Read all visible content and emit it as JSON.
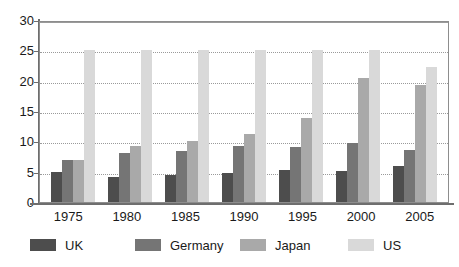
{
  "chart_data": {
    "type": "bar",
    "title": "",
    "subtitle": "",
    "xlabel": "",
    "ylabel": "",
    "categories": [
      "1975",
      "1980",
      "1985",
      "1990",
      "1995",
      "2000",
      "2005"
    ],
    "series": [
      {
        "name": "UK",
        "color": "#4d4d4d",
        "values": [
          5.0,
          4.2,
          4.5,
          4.8,
          5.2,
          5.1,
          5.9
        ]
      },
      {
        "name": "Germany",
        "color": "#757575",
        "values": [
          6.9,
          8.1,
          8.4,
          9.2,
          9.0,
          9.7,
          8.6
        ]
      },
      {
        "name": "Japan",
        "color": "#a9a9a9",
        "values": [
          7.0,
          9.2,
          10.0,
          11.2,
          13.8,
          20.4,
          19.3
        ]
      },
      {
        "name": "US",
        "color": "#d9d9d9",
        "values": [
          25.0,
          25.0,
          25.0,
          25.0,
          25.0,
          25.0,
          22.3
        ]
      }
    ],
    "ylim": [
      0,
      30
    ],
    "ytick_values": [
      0,
      5,
      10,
      15,
      20,
      25,
      30
    ],
    "ytick_labels": [
      "0",
      "5",
      "10",
      "15",
      "20",
      "25",
      "30"
    ],
    "grid": true,
    "grid_axis": "y",
    "legend_position": "bottom",
    "note_clipped_series": "US bars for 1975-2000 are drawn clipped at the 25 gridline"
  },
  "legend": {
    "items": [
      {
        "label": "UK",
        "color": "#4d4d4d"
      },
      {
        "label": "Germany",
        "color": "#757575"
      },
      {
        "label": "Japan",
        "color": "#a9a9a9"
      },
      {
        "label": "US",
        "color": "#d9d9d9"
      }
    ]
  },
  "axes": {
    "y_labels": [
      "30",
      "25",
      "20",
      "15",
      "10",
      "5",
      "0"
    ],
    "x_labels": [
      "1975",
      "1980",
      "1985",
      "1990",
      "1995",
      "2000",
      "2005"
    ]
  }
}
